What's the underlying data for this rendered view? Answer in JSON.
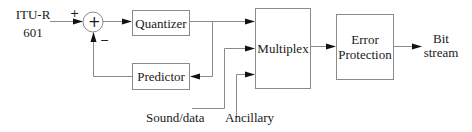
{
  "diagram": {
    "type": "block-diagram",
    "input": {
      "line1": "ITU-R",
      "line2": "601"
    },
    "summing_junction": {
      "symbol": "+",
      "plus_sign": "+",
      "minus_sign": "−"
    },
    "blocks": {
      "quantizer": "Quantizer",
      "predictor": "Predictor",
      "multiplex": "Multiplex",
      "error_protection_line1": "Error",
      "error_protection_line2": "Protection"
    },
    "side_inputs": {
      "sound_data": "Sound/data",
      "ancillary": "Ancillary"
    },
    "output": {
      "line1": "Bit",
      "line2": "stream"
    },
    "colors": {
      "line": "#8a8a8a",
      "arrowhead": "#111111",
      "text": "#1a1a1a"
    }
  }
}
